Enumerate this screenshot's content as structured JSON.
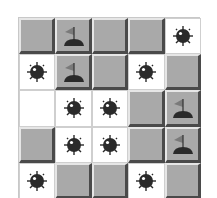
{
  "game": {
    "title": "Minesweeper",
    "rows": 5,
    "cols": 5,
    "colors": {
      "covered": "#a9a9a9",
      "revealed": "#ffffff",
      "mine": "#2a2a2a",
      "flag": "#7a7a7a"
    },
    "grid": [
      [
        "covered",
        "flag",
        "covered",
        "covered",
        "mine"
      ],
      [
        "mine",
        "flag",
        "covered",
        "mine",
        "covered"
      ],
      [
        "empty",
        "mine",
        "mine",
        "covered",
        "flag"
      ],
      [
        "covered",
        "mine",
        "mine",
        "covered",
        "flag"
      ],
      [
        "mine",
        "covered",
        "covered",
        "mine",
        "covered"
      ]
    ],
    "icons": {
      "mine": "mine-icon",
      "flag": "flag-icon"
    }
  }
}
